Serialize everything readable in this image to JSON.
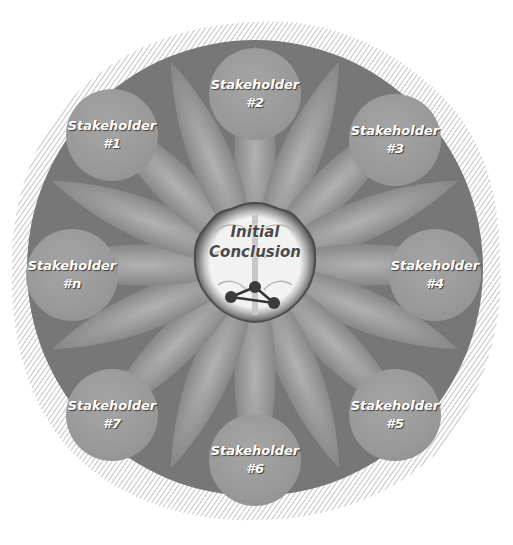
{
  "diagram": {
    "type": "radial-hub-and-spoke",
    "colors": {
      "background": "#ffffff",
      "outer_ring": "#7c7c7c",
      "petal_light": "#a8a8a8",
      "petal_dark": "#6e6e6e",
      "node_fill": "#9c9c9c",
      "node_text": "#ffffff",
      "center_fill": "#f0f0f0",
      "center_border": "#5a5a5a",
      "center_text": "#4a4a4a"
    },
    "center": {
      "line1": "Initial",
      "line2": "Conclusion",
      "icon": "brain-with-network-icon"
    },
    "nodes": [
      {
        "id": "2",
        "label": "Stakeholder",
        "number": "#2"
      },
      {
        "id": "3",
        "label": "Stakeholder",
        "number": "#3"
      },
      {
        "id": "4",
        "label": "Stakeholder",
        "number": "#4"
      },
      {
        "id": "5",
        "label": "Stakeholder",
        "number": "#5"
      },
      {
        "id": "6",
        "label": "Stakeholder",
        "number": "#6"
      },
      {
        "id": "7",
        "label": "Stakeholder",
        "number": "#7"
      },
      {
        "id": "n",
        "label": "Stakeholder",
        "number": "#n"
      },
      {
        "id": "1",
        "label": "Stakeholder",
        "number": "#1"
      }
    ]
  }
}
